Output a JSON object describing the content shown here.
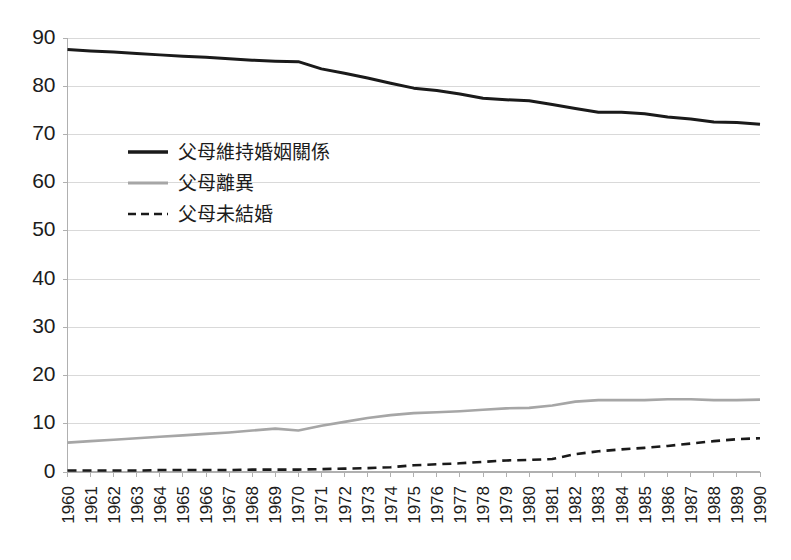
{
  "chart_data": {
    "type": "line",
    "title": "",
    "subtitle": "",
    "xlabel": "",
    "ylabel": "",
    "xlim": [
      1960,
      1990
    ],
    "ylim": [
      0,
      90
    ],
    "ytick_step": 10,
    "grid": true,
    "grid_axis": "y",
    "legend_position": "inside-upper-left",
    "x": [
      1960,
      1961,
      1962,
      1963,
      1964,
      1965,
      1966,
      1967,
      1968,
      1969,
      1970,
      1971,
      1972,
      1973,
      1974,
      1975,
      1976,
      1977,
      1978,
      1979,
      1980,
      1981,
      1982,
      1983,
      1984,
      1985,
      1986,
      1987,
      1988,
      1989,
      1990
    ],
    "categories": [
      "1960",
      "1961",
      "1962",
      "1963",
      "1964",
      "1965",
      "1966",
      "1967",
      "1968",
      "1969",
      "1970",
      "1971",
      "1972",
      "1973",
      "1974",
      "1975",
      "1976",
      "1977",
      "1978",
      "1979",
      "1980",
      "1981",
      "1982",
      "1983",
      "1984",
      "1985",
      "1986",
      "1987",
      "1988",
      "1989",
      "1990"
    ],
    "yticks": [
      0,
      10,
      20,
      30,
      40,
      50,
      60,
      70,
      80,
      90
    ],
    "series": [
      {
        "name": "父母維持婚姻關係",
        "style": "solid",
        "color": "#1a1a1a",
        "width": 3,
        "values": [
          87.6,
          87.3,
          87.1,
          86.8,
          86.5,
          86.2,
          86.0,
          85.7,
          85.4,
          85.2,
          85.1,
          83.6,
          82.7,
          81.7,
          80.6,
          79.6,
          79.1,
          78.4,
          77.5,
          77.2,
          77.0,
          76.2,
          75.4,
          74.6,
          74.6,
          74.3,
          73.6,
          73.2,
          72.6,
          72.5,
          72.1
        ]
      },
      {
        "name": "父母離異",
        "style": "solid",
        "color": "#a6a6a6",
        "width": 2.6,
        "values": [
          6.1,
          6.4,
          6.7,
          7.0,
          7.3,
          7.6,
          7.9,
          8.2,
          8.6,
          9.0,
          8.6,
          9.6,
          10.4,
          11.2,
          11.8,
          12.2,
          12.4,
          12.6,
          12.9,
          13.2,
          13.3,
          13.8,
          14.6,
          14.9,
          14.9,
          14.9,
          15.1,
          15.1,
          14.9,
          14.9,
          15.0
        ]
      },
      {
        "name": "父母未結婚",
        "style": "dashed",
        "color": "#1a1a1a",
        "width": 2.6,
        "values": [
          0.3,
          0.3,
          0.3,
          0.3,
          0.4,
          0.4,
          0.4,
          0.4,
          0.5,
          0.5,
          0.5,
          0.6,
          0.7,
          0.8,
          1.0,
          1.4,
          1.6,
          1.8,
          2.1,
          2.4,
          2.5,
          2.7,
          3.7,
          4.3,
          4.7,
          5.0,
          5.4,
          5.9,
          6.4,
          6.8,
          7.0
        ]
      }
    ]
  },
  "legend": {
    "entries": [
      {
        "label": "父母維持婚姻關係",
        "style": "solid-thick",
        "color": "#1a1a1a"
      },
      {
        "label": "父母離異",
        "style": "solid-thin",
        "color": "#a6a6a6"
      },
      {
        "label": "父母未結婚",
        "style": "dashed",
        "color": "#1a1a1a"
      }
    ]
  },
  "colors": {
    "background": "#ffffff",
    "grid": "#d9d9d9",
    "axis": "#b0b0b0",
    "text": "#1c1c1c",
    "series_married": "#1a1a1a",
    "series_divorced": "#a6a6a6",
    "series_unmarried": "#1a1a1a"
  }
}
